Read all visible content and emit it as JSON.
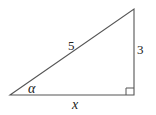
{
  "diagram": {
    "type": "right-triangle",
    "vertices": {
      "left": [
        10,
        95
      ],
      "right_angle": [
        134,
        95
      ],
      "top": [
        134,
        9
      ]
    },
    "labels": {
      "hypotenuse": "5",
      "opposite": "3",
      "adjacent": "x",
      "angle": "α"
    },
    "right_angle_marker": true,
    "stroke_color": "#555555"
  }
}
